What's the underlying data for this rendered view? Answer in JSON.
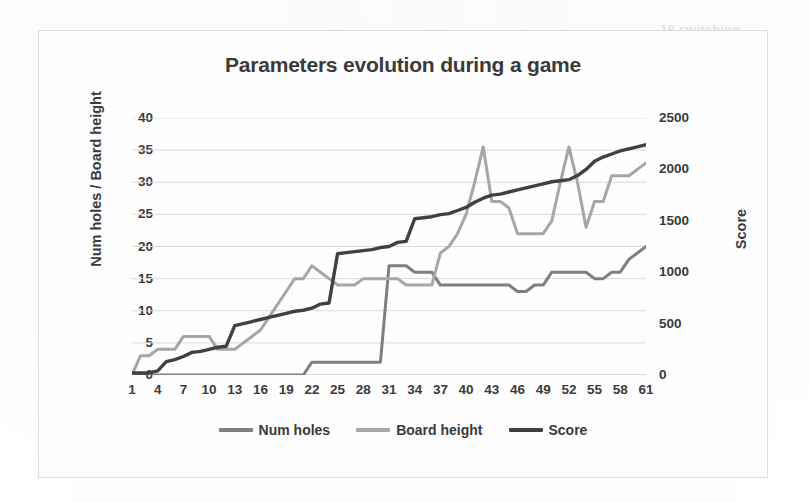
{
  "chart_data": {
    "type": "line",
    "title": "Parameters evolution during a game",
    "xlabel": "",
    "ylabel": "Num holes / Board height",
    "y2label": "Score",
    "ylim": [
      0,
      40
    ],
    "y2lim": [
      0,
      2500
    ],
    "xlim": [
      1,
      61
    ],
    "grid": true,
    "legend_position": "bottom",
    "yticks": [
      0,
      5,
      10,
      15,
      20,
      25,
      30,
      35,
      40
    ],
    "y2ticks": [
      0,
      500,
      1000,
      1500,
      2000,
      2500
    ],
    "xticks": [
      1,
      4,
      7,
      10,
      13,
      16,
      19,
      22,
      25,
      28,
      31,
      34,
      37,
      40,
      43,
      46,
      49,
      52,
      55,
      58,
      61
    ],
    "x": [
      1,
      2,
      3,
      4,
      5,
      6,
      7,
      8,
      9,
      10,
      11,
      12,
      13,
      14,
      15,
      16,
      17,
      18,
      19,
      20,
      21,
      22,
      23,
      24,
      25,
      26,
      27,
      28,
      29,
      30,
      31,
      32,
      33,
      34,
      35,
      36,
      37,
      38,
      39,
      40,
      41,
      42,
      43,
      44,
      45,
      46,
      47,
      48,
      49,
      50,
      51,
      52,
      53,
      54,
      55,
      56,
      57,
      58,
      59,
      60,
      61
    ],
    "series": [
      {
        "name": "Num holes",
        "axis": "left",
        "color": "#7f7f7f",
        "values": [
          0,
          0,
          0,
          0,
          0,
          0,
          0,
          0,
          0,
          0,
          0,
          0,
          0,
          0,
          0,
          0,
          0,
          0,
          0,
          0,
          0,
          2,
          2,
          2,
          2,
          2,
          2,
          2,
          2,
          2,
          17,
          17,
          17,
          16,
          16,
          16,
          14,
          14,
          14,
          14,
          14,
          14,
          14,
          14,
          14,
          13,
          13,
          14,
          14,
          16,
          16,
          16,
          16,
          16,
          15,
          15,
          16,
          16,
          18,
          19,
          20
        ]
      },
      {
        "name": "Board height",
        "axis": "left",
        "color": "#a6a6a6",
        "values": [
          0,
          3,
          3,
          4,
          4,
          4,
          6,
          6,
          6,
          6,
          4,
          4,
          4,
          5,
          6,
          7,
          9,
          11,
          13,
          15,
          15,
          17,
          16,
          15,
          14,
          14,
          14,
          15,
          15,
          15,
          15,
          15,
          14,
          14,
          14,
          14,
          19,
          20,
          22,
          25,
          30,
          35.5,
          27,
          27,
          26,
          22,
          22,
          22,
          22,
          24,
          30,
          35.5,
          30,
          23,
          27,
          27,
          31,
          31,
          31,
          32,
          33
        ]
      },
      {
        "name": "Score",
        "axis": "right",
        "color": "#404040",
        "values": [
          20,
          20,
          20,
          40,
          130,
          150,
          180,
          220,
          230,
          250,
          270,
          280,
          480,
          500,
          520,
          540,
          560,
          580,
          600,
          620,
          630,
          650,
          690,
          700,
          1180,
          1190,
          1200,
          1210,
          1220,
          1240,
          1250,
          1290,
          1300,
          1520,
          1530,
          1540,
          1560,
          1570,
          1600,
          1630,
          1680,
          1720,
          1750,
          1760,
          1780,
          1800,
          1820,
          1840,
          1860,
          1880,
          1890,
          1900,
          1940,
          2000,
          2080,
          2120,
          2150,
          2180,
          2200,
          2220,
          2240
        ]
      }
    ]
  },
  "legend": {
    "items": [
      {
        "label": "Num holes",
        "color": "#7f7f7f"
      },
      {
        "label": "Board height",
        "color": "#a6a6a6"
      },
      {
        "label": "Score",
        "color": "#404040"
      }
    ]
  },
  "ghost": {
    "top_left": "18 switching",
    "top_right": ""
  }
}
